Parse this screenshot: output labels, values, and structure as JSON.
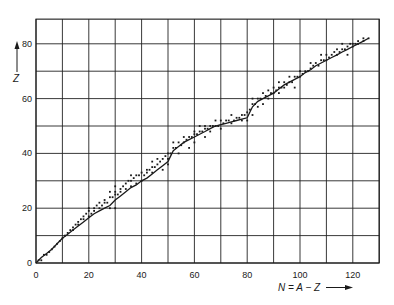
{
  "chart_data": {
    "type": "scatter",
    "title": "",
    "xlabel": "N = A − Z",
    "ylabel": "Z",
    "xlim": [
      0,
      130
    ],
    "ylim": [
      0,
      89
    ],
    "grid": true,
    "x_ticks": [
      0,
      20,
      40,
      60,
      80,
      100,
      120
    ],
    "y_ticks": [
      0,
      20,
      40,
      60,
      80
    ],
    "x_gridlines": [
      0,
      10,
      20,
      30,
      40,
      50,
      60,
      70,
      80,
      90,
      100,
      110,
      120,
      130
    ],
    "y_gridlines": [
      0,
      10,
      20,
      30,
      40,
      50,
      60,
      70,
      80
    ],
    "legend": null,
    "series": [
      {
        "name": "stability line (line of stable nuclei)",
        "style": "line",
        "points": [
          [
            0,
            0
          ],
          [
            2,
            2
          ],
          [
            4,
            3.5
          ],
          [
            6,
            5
          ],
          [
            8,
            7
          ],
          [
            10,
            9
          ],
          [
            12,
            10.5
          ],
          [
            14,
            12
          ],
          [
            16,
            13.5
          ],
          [
            18,
            15
          ],
          [
            20,
            16.5
          ],
          [
            22,
            18
          ],
          [
            24,
            19
          ],
          [
            26,
            20
          ],
          [
            28,
            21
          ],
          [
            30,
            23
          ],
          [
            32,
            24.5
          ],
          [
            34,
            26
          ],
          [
            36,
            27.5
          ],
          [
            38,
            28.5
          ],
          [
            40,
            30
          ],
          [
            42,
            31
          ],
          [
            44,
            32.5
          ],
          [
            46,
            34
          ],
          [
            48,
            35.5
          ],
          [
            50,
            37
          ],
          [
            51,
            39
          ],
          [
            52,
            41
          ],
          [
            54,
            42.5
          ],
          [
            56,
            44
          ],
          [
            58,
            45
          ],
          [
            60,
            46
          ],
          [
            62,
            47
          ],
          [
            64,
            48
          ],
          [
            66,
            49
          ],
          [
            68,
            50
          ],
          [
            70,
            50.5
          ],
          [
            72,
            51
          ],
          [
            74,
            51.5
          ],
          [
            76,
            52
          ],
          [
            78,
            52.5
          ],
          [
            80,
            53
          ],
          [
            81,
            55
          ],
          [
            82,
            57
          ],
          [
            84,
            59
          ],
          [
            86,
            60
          ],
          [
            88,
            61
          ],
          [
            90,
            62
          ],
          [
            92,
            63.5
          ],
          [
            94,
            65
          ],
          [
            96,
            66
          ],
          [
            98,
            67
          ],
          [
            100,
            68
          ],
          [
            102,
            69.5
          ],
          [
            104,
            70.5
          ],
          [
            106,
            72
          ],
          [
            108,
            73
          ],
          [
            110,
            74
          ],
          [
            112,
            75
          ],
          [
            114,
            76
          ],
          [
            116,
            77
          ],
          [
            118,
            78
          ],
          [
            120,
            79
          ],
          [
            122,
            80
          ],
          [
            124,
            81
          ],
          [
            126,
            82
          ]
        ]
      },
      {
        "name": "stable isotopes",
        "style": "points",
        "points": [
          [
            1,
            1
          ],
          [
            2,
            1
          ],
          [
            3,
            3
          ],
          [
            4,
            3
          ],
          [
            5,
            4
          ],
          [
            6,
            5
          ],
          [
            7,
            6
          ],
          [
            8,
            7
          ],
          [
            9,
            8
          ],
          [
            10,
            9
          ],
          [
            11,
            10
          ],
          [
            12,
            11
          ],
          [
            13,
            12
          ],
          [
            14,
            12
          ],
          [
            14,
            13
          ],
          [
            15,
            14
          ],
          [
            16,
            14
          ],
          [
            16,
            15
          ],
          [
            17,
            16
          ],
          [
            18,
            16
          ],
          [
            18,
            17
          ],
          [
            19,
            18
          ],
          [
            20,
            17
          ],
          [
            20,
            19
          ],
          [
            20,
            20
          ],
          [
            21,
            18
          ],
          [
            22,
            19
          ],
          [
            22,
            20
          ],
          [
            23,
            21
          ],
          [
            24,
            20
          ],
          [
            24,
            22
          ],
          [
            25,
            21
          ],
          [
            26,
            22
          ],
          [
            26,
            23
          ],
          [
            27,
            22
          ],
          [
            28,
            20
          ],
          [
            28,
            24
          ],
          [
            28,
            26
          ],
          [
            29,
            24
          ],
          [
            30,
            20
          ],
          [
            30,
            25
          ],
          [
            30,
            26
          ],
          [
            30,
            28
          ],
          [
            31,
            25
          ],
          [
            32,
            26
          ],
          [
            32,
            27
          ],
          [
            33,
            28
          ],
          [
            34,
            27
          ],
          [
            34,
            29
          ],
          [
            35,
            30
          ],
          [
            36,
            28
          ],
          [
            36,
            30
          ],
          [
            36,
            32
          ],
          [
            37,
            31
          ],
          [
            38,
            29
          ],
          [
            38,
            32
          ],
          [
            39,
            32
          ],
          [
            40,
            30
          ],
          [
            40,
            33
          ],
          [
            41,
            32
          ],
          [
            42,
            33
          ],
          [
            42,
            34
          ],
          [
            43,
            34
          ],
          [
            44,
            33
          ],
          [
            44,
            35
          ],
          [
            44,
            37
          ],
          [
            45,
            35
          ],
          [
            46,
            36
          ],
          [
            46,
            38
          ],
          [
            47,
            37
          ],
          [
            48,
            34
          ],
          [
            48,
            38
          ],
          [
            49,
            39
          ],
          [
            50,
            36
          ],
          [
            50,
            38
          ],
          [
            50,
            40
          ],
          [
            51,
            40
          ],
          [
            52,
            42
          ],
          [
            52,
            44
          ],
          [
            53,
            42
          ],
          [
            54,
            40
          ],
          [
            54,
            44
          ],
          [
            55,
            43
          ],
          [
            56,
            44
          ],
          [
            56,
            46
          ],
          [
            57,
            45
          ],
          [
            58,
            42
          ],
          [
            58,
            46
          ],
          [
            59,
            46
          ],
          [
            60,
            44
          ],
          [
            60,
            47
          ],
          [
            60,
            48
          ],
          [
            61,
            47
          ],
          [
            62,
            48
          ],
          [
            62,
            50
          ],
          [
            63,
            48
          ],
          [
            64,
            46
          ],
          [
            64,
            49
          ],
          [
            64,
            50
          ],
          [
            65,
            49
          ],
          [
            66,
            48
          ],
          [
            66,
            50
          ],
          [
            67,
            50
          ],
          [
            68,
            50
          ],
          [
            68,
            52
          ],
          [
            69,
            50
          ],
          [
            70,
            49
          ],
          [
            70,
            52
          ],
          [
            71,
            51
          ],
          [
            72,
            52
          ],
          [
            73,
            52
          ],
          [
            74,
            51
          ],
          [
            74,
            54
          ],
          [
            75,
            52
          ],
          [
            76,
            53
          ],
          [
            77,
            53
          ],
          [
            78,
            52
          ],
          [
            78,
            54
          ],
          [
            79,
            54
          ],
          [
            80,
            52
          ],
          [
            80,
            55
          ],
          [
            81,
            56
          ],
          [
            82,
            54
          ],
          [
            82,
            58
          ],
          [
            82,
            60
          ],
          [
            83,
            58
          ],
          [
            84,
            57
          ],
          [
            84,
            60
          ],
          [
            85,
            60
          ],
          [
            86,
            58
          ],
          [
            86,
            62
          ],
          [
            87,
            61
          ],
          [
            88,
            60
          ],
          [
            88,
            63
          ],
          [
            89,
            62
          ],
          [
            90,
            62
          ],
          [
            90,
            64
          ],
          [
            91,
            63
          ],
          [
            92,
            62
          ],
          [
            92,
            64
          ],
          [
            92,
            66
          ],
          [
            93,
            64
          ],
          [
            94,
            64
          ],
          [
            94,
            66
          ],
          [
            95,
            65
          ],
          [
            96,
            66
          ],
          [
            96,
            68
          ],
          [
            97,
            66
          ],
          [
            98,
            64
          ],
          [
            98,
            68
          ],
          [
            99,
            68
          ],
          [
            100,
            68
          ],
          [
            100,
            70
          ],
          [
            101,
            69
          ],
          [
            102,
            70
          ],
          [
            103,
            70
          ],
          [
            104,
            71
          ],
          [
            104,
            73
          ],
          [
            105,
            72
          ],
          [
            106,
            73
          ],
          [
            107,
            72
          ],
          [
            108,
            74
          ],
          [
            108,
            76
          ],
          [
            109,
            74
          ],
          [
            110,
            74
          ],
          [
            110,
            76
          ],
          [
            111,
            75
          ],
          [
            112,
            76
          ],
          [
            113,
            77
          ],
          [
            114,
            76
          ],
          [
            114,
            78
          ],
          [
            115,
            77
          ],
          [
            116,
            78
          ],
          [
            116,
            80
          ],
          [
            117,
            78
          ],
          [
            118,
            79
          ],
          [
            118,
            76
          ],
          [
            119,
            80
          ],
          [
            120,
            79
          ],
          [
            120,
            80
          ],
          [
            121,
            80
          ],
          [
            122,
            80
          ],
          [
            122,
            81
          ],
          [
            124,
            81
          ],
          [
            124,
            82
          ],
          [
            126,
            82
          ]
        ]
      }
    ]
  },
  "labels": {
    "x_axis": "N = A − Z",
    "y_axis": "Z",
    "x_arrow": "→",
    "y_arrow": "↑"
  },
  "colors": {
    "ink": "#1a1a1a",
    "grid": "#222222",
    "background": "#ffffff"
  }
}
